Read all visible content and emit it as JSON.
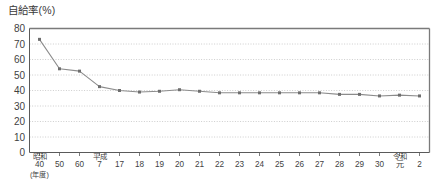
{
  "chart_data": {
    "type": "line",
    "title": "自給率(%)",
    "xlabel": "(年度)",
    "ylabel": "自給率(%)",
    "ylim": [
      0,
      80
    ],
    "ytick_step": 10,
    "yticks": [
      "0",
      "10",
      "20",
      "30",
      "40",
      "50",
      "60",
      "70",
      "80"
    ],
    "grid": true,
    "grid_axis": "y",
    "legend": "none",
    "series_color": "#8c8c8c",
    "marker_color": "#6e6e6e",
    "categories": [
      "40",
      "50",
      "60",
      "7",
      "17",
      "18",
      "19",
      "20",
      "21",
      "22",
      "23",
      "24",
      "25",
      "26",
      "27",
      "28",
      "29",
      "30",
      "元",
      "2"
    ],
    "era_labels": [
      {
        "index": 0,
        "text": "昭和"
      },
      {
        "index": 3,
        "text": "平成"
      },
      {
        "index": 18,
        "text": "令和"
      }
    ],
    "unit_label": {
      "index": 0,
      "text": "(年度)"
    },
    "values": [
      73,
      54,
      52.5,
      42.5,
      40,
      39,
      39.5,
      40.5,
      39.5,
      38.5,
      38.5,
      38.5,
      38.5,
      38.5,
      38.5,
      37.5,
      37.5,
      36.5,
      37,
      36.5
    ]
  }
}
